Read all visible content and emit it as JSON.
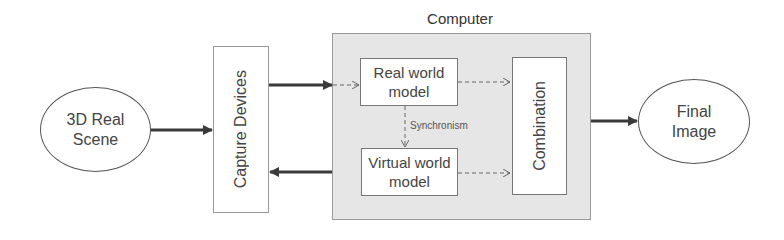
{
  "diagram": {
    "nodes": {
      "scene": {
        "line1": "3D Real",
        "line2": "Scene"
      },
      "capture": {
        "label": "Capture Devices"
      },
      "computer": {
        "label": "Computer"
      },
      "real_model": {
        "line1": "Real world",
        "line2": "model"
      },
      "virtual_model": {
        "line1": "Virtual world",
        "line2": "model"
      },
      "combination": {
        "label": "Combination"
      },
      "final": {
        "line1": "Final",
        "line2": "Image"
      }
    },
    "edges": {
      "sync_label": "Synchronism"
    },
    "colors": {
      "computer_fill": "#e6e6e6",
      "arrow": "#3a3a3a",
      "dashed": "#666666"
    }
  }
}
